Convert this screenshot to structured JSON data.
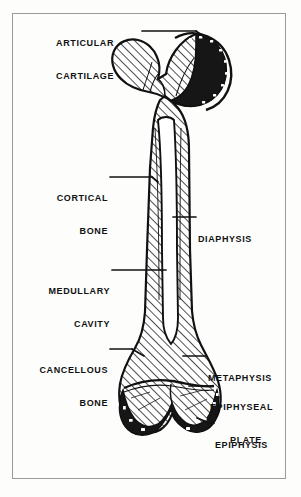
{
  "figure": {
    "background_color": "#fdfdfc",
    "border_color": "#9a9a9a",
    "ink_color": "#111111"
  },
  "labels": [
    {
      "id": "articular-cartilage",
      "text_lines": [
        "ARTICULAR",
        "CARTILAGE"
      ],
      "line1": "ARTICULAR",
      "line2": "CARTILAGE",
      "side": "left",
      "points_to": "femoral head cartilage cap"
    },
    {
      "id": "cortical-bone",
      "text_lines": [
        "CORTICAL",
        "BONE"
      ],
      "line1": "CORTICAL",
      "line2": "BONE",
      "side": "left",
      "points_to": "hatched shaft wall"
    },
    {
      "id": "diaphysis",
      "text_lines": [
        "DIAPHYSIS"
      ],
      "line1": "DIAPHYSIS",
      "line2": "",
      "side": "right",
      "points_to": "bone shaft"
    },
    {
      "id": "medullary-cavity",
      "text_lines": [
        "MEDULLARY",
        "CAVITY"
      ],
      "line1": "MEDULLARY",
      "line2": "CAVITY",
      "side": "left",
      "points_to": "hollow marrow channel"
    },
    {
      "id": "cancellous-bone",
      "text_lines": [
        "CANCELLOUS",
        "BONE"
      ],
      "line1": "CANCELLOUS",
      "line2": "BONE",
      "side": "left",
      "points_to": "spongy bone at distal flare"
    },
    {
      "id": "metaphysis",
      "text_lines": [
        "METAPHYSIS"
      ],
      "line1": "METAPHYSIS",
      "line2": "",
      "side": "right",
      "points_to": "flared region above growth plate"
    },
    {
      "id": "epiphyseal-plate",
      "text_lines": [
        "EPIPHYSEAL",
        "PLATE"
      ],
      "line1": "EPIPHYSEAL",
      "line2": "PLATE",
      "side": "right",
      "points_to": "growth plate line"
    },
    {
      "id": "epiphysis",
      "text_lines": [
        "EPIPHYSIS"
      ],
      "line1": "EPIPHYSIS",
      "line2": "",
      "side": "right",
      "points_to": "distal condyles"
    }
  ]
}
